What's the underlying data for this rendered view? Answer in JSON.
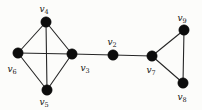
{
  "figure": {
    "background_color": "#fcfcfa",
    "node_color": "#0c0c0c",
    "edge_color": "#262626",
    "label_color": "#141414",
    "node_radius": 5.2,
    "nodes": [
      {
        "id": "v4",
        "label_base": "v",
        "label_sub": "4",
        "x": 46,
        "y": 22,
        "lx": 44,
        "ly": 12
      },
      {
        "id": "v6",
        "label_base": "v",
        "label_sub": "6",
        "x": 18,
        "y": 53,
        "lx": 12,
        "ly": 72
      },
      {
        "id": "v3",
        "label_base": "v",
        "label_sub": "3",
        "x": 72,
        "y": 54,
        "lx": 85,
        "ly": 71
      },
      {
        "id": "v5",
        "label_base": "v",
        "label_sub": "5",
        "x": 47,
        "y": 90,
        "lx": 44,
        "ly": 105
      },
      {
        "id": "v2",
        "label_base": "v",
        "label_sub": "2",
        "x": 113,
        "y": 55,
        "lx": 112,
        "ly": 45
      },
      {
        "id": "v7",
        "label_base": "v",
        "label_sub": "7",
        "x": 152,
        "y": 56,
        "lx": 151,
        "ly": 73
      },
      {
        "id": "v9",
        "label_base": "v",
        "label_sub": "9",
        "x": 184,
        "y": 30,
        "lx": 182,
        "ly": 21
      },
      {
        "id": "v8",
        "label_base": "v",
        "label_sub": "8",
        "x": 183,
        "y": 83,
        "lx": 182,
        "ly": 100
      }
    ],
    "edges": [
      [
        "v4",
        "v6"
      ],
      [
        "v4",
        "v3"
      ],
      [
        "v4",
        "v5"
      ],
      [
        "v6",
        "v3"
      ],
      [
        "v6",
        "v5"
      ],
      [
        "v3",
        "v5"
      ],
      [
        "v3",
        "v2"
      ],
      [
        "v2",
        "v7"
      ],
      [
        "v7",
        "v9"
      ],
      [
        "v7",
        "v8"
      ],
      [
        "v9",
        "v8"
      ]
    ]
  }
}
